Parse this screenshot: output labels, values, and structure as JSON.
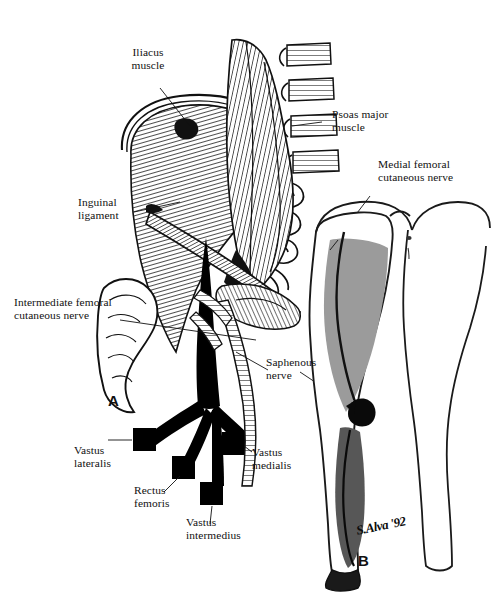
{
  "figure": {
    "top_caption": "Nerves of the lumbar plexus distribution",
    "panel_a_letter": "A",
    "panel_b_letter": "B",
    "signature": "S.Alva '92",
    "colors": {
      "ink": "#111111",
      "nerve_black": "#000000",
      "skin_outline": "#1a1a1a",
      "thigh_shade": "#9b9b9b",
      "leg_shade": "#575757",
      "paper": "#ffffff"
    }
  },
  "labels": {
    "iliacus": "Iliacus\nmuscle",
    "psoas": "Psoas major\nmuscle",
    "medial_femoral": "Medial femoral\ncutaneous nerve",
    "inguinal": "Inguinal\nligament",
    "intermediate_femoral": "Intermediate femoral\ncutaneous nerve",
    "saphenous": "Saphenous\nnerve",
    "vastus_lateralis": "Vastus\nlateralis",
    "rectus_femoris": "Rectus\nfemoris",
    "vastus_intermedius": "Vastus\nintermedius",
    "vastus_medialis": "Vastus\nmedialis"
  }
}
